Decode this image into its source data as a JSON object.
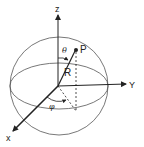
{
  "diagram": {
    "labels": {
      "z_axis": "z",
      "y_axis": "Y",
      "x_axis": "x",
      "point": "P",
      "radius": "R",
      "theta": "θ",
      "phi": "φ"
    },
    "colors": {
      "stroke": "#222222",
      "sphere": "#555555",
      "background": "#ffffff"
    }
  }
}
